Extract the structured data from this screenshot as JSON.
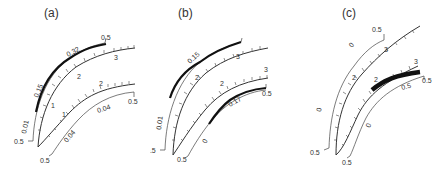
{
  "figure": {
    "panels": [
      {
        "label": "(a)",
        "outer_curve": {
          "scale_labels": [
            "1",
            "2",
            "3"
          ],
          "end_labels": [
            "0.5",
            "0.5"
          ],
          "segment_labels": [
            "0.01",
            "0.15",
            "0.32"
          ]
        },
        "inner_curve": {
          "scale_labels": [
            "1",
            "2"
          ],
          "end_labels": [
            "0.5",
            "0.5"
          ],
          "segment_labels": [
            "0.04",
            "0.04"
          ]
        }
      },
      {
        "label": "(b)",
        "outer_curve": {
          "scale_labels": [
            "1",
            "2",
            "3"
          ],
          "end_labels": [
            "0.5"
          ],
          "segment_labels": [
            "0.01",
            "0.15"
          ]
        },
        "inner_curve": {
          "scale_labels": [
            "1",
            "2",
            "3"
          ],
          "end_labels": [
            "0.5",
            "0.5"
          ],
          "segment_labels": [
            "0",
            "0.17"
          ]
        }
      },
      {
        "label": "(c)",
        "outer_curve": {
          "scale_labels": [
            "1",
            "2",
            "3"
          ],
          "end_labels": [
            "0.5",
            "0.5"
          ],
          "segment_labels": [
            "0",
            "0"
          ]
        },
        "inner_curve": {
          "scale_labels": [
            "1",
            "2",
            "3"
          ],
          "end_labels": [
            "0.5",
            "0.5"
          ],
          "segment_labels": [
            "0",
            "0.5"
          ]
        }
      }
    ]
  }
}
